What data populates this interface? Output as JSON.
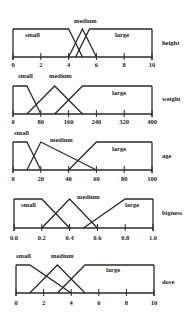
{
  "diagram": {
    "type": "fuzzy-membership-functions",
    "line_color": "#2a2a2a",
    "panels": [
      {
        "variable": "height",
        "frame": {
          "left": 13,
          "right": 152,
          "top": 29,
          "base": 57
        },
        "xmin": 0,
        "xmax": 10,
        "ticks": [
          "0",
          "2",
          "4",
          "6",
          "8",
          "10"
        ],
        "label_y": 43,
        "tick_label_y": 67,
        "sets": [
          {
            "name": "small",
            "points": [
              [
                0,
                1
              ],
              [
                4,
                1
              ],
              [
                5,
                0
              ]
            ],
            "label_x": 25,
            "label_y": 37
          },
          {
            "name": "medium",
            "points": [
              [
                4,
                0
              ],
              [
                5,
                1
              ],
              [
                6,
                0
              ]
            ],
            "label_x": 74,
            "label_y": 23
          },
          {
            "name": "large",
            "points": [
              [
                4.5,
                0
              ],
              [
                5.5,
                1
              ],
              [
                10,
                1
              ]
            ],
            "label_x": 115,
            "label_y": 37
          }
        ]
      },
      {
        "variable": "weight",
        "frame": {
          "left": 13,
          "right": 152,
          "top": 86,
          "base": 114
        },
        "xmin": 0,
        "xmax": 400,
        "ticks": [
          "0",
          "80",
          "160",
          "240",
          "320",
          "400"
        ],
        "label_y": 99,
        "tick_label_y": 124,
        "sets": [
          {
            "name": "small",
            "points": [
              [
                0,
                1
              ],
              [
                40,
                1
              ],
              [
                80,
                0
              ]
            ],
            "label_x": 18,
            "label_y": 78
          },
          {
            "name": "medium",
            "points": [
              [
                40,
                0
              ],
              [
                120,
                1
              ],
              [
                200,
                0
              ]
            ],
            "label_x": 49,
            "label_y": 78
          },
          {
            "name": "large",
            "points": [
              [
                120,
                0
              ],
              [
                200,
                1
              ],
              [
                400,
                1
              ]
            ],
            "label_x": 112,
            "label_y": 95
          }
        ]
      },
      {
        "variable": "age",
        "frame": {
          "left": 13,
          "right": 152,
          "top": 142,
          "base": 170
        },
        "xmin": 0,
        "xmax": 100,
        "ticks": [
          "0",
          "20",
          "40",
          "60",
          "80",
          "100"
        ],
        "label_y": 156,
        "tick_label_y": 181,
        "sets": [
          {
            "name": "small",
            "points": [
              [
                0,
                1
              ],
              [
                10,
                1
              ],
              [
                20,
                0
              ]
            ],
            "label_x": 14,
            "label_y": 135
          },
          {
            "name": "medium",
            "points": [
              [
                10,
                0
              ],
              [
                20,
                1
              ],
              [
                60,
                0
              ]
            ],
            "label_x": 50,
            "label_y": 142
          },
          {
            "name": "large",
            "points": [
              [
                40,
                0
              ],
              [
                60,
                1
              ],
              [
                100,
                1
              ]
            ],
            "label_x": 112,
            "label_y": 151
          }
        ]
      },
      {
        "variable": "bigness",
        "frame": {
          "left": 14,
          "right": 153,
          "top": 199,
          "base": 228
        },
        "xmin": 0.0,
        "xmax": 1.0,
        "ticks": [
          "0.0",
          "0.2",
          "0.4",
          "0.6",
          "0.8",
          "1.0"
        ],
        "label_y": 213,
        "tick_label_y": 240,
        "sets": [
          {
            "name": "small",
            "points": [
              [
                0,
                1
              ],
              [
                0.2,
                1
              ],
              [
                0.4,
                0
              ]
            ],
            "label_x": 21,
            "label_y": 207
          },
          {
            "name": "medium",
            "points": [
              [
                0.2,
                0
              ],
              [
                0.4,
                1
              ],
              [
                0.6,
                0
              ]
            ],
            "label_x": 77,
            "label_y": 199
          },
          {
            "name": "large",
            "points": [
              [
                0.5,
                0
              ],
              [
                0.8,
                1
              ],
              [
                1.0,
                1
              ]
            ],
            "label_x": 125,
            "label_y": 207
          }
        ]
      },
      {
        "variable": "dose",
        "frame": {
          "left": 16,
          "right": 154,
          "top": 265,
          "base": 293
        },
        "xmin": 0,
        "xmax": 10,
        "ticks": [
          "0",
          "2",
          "4",
          "6",
          "8",
          "10"
        ],
        "label_y": 282,
        "tick_label_y": 305,
        "sets": [
          {
            "name": "small",
            "points": [
              [
                0,
                1
              ],
              [
                1,
                1
              ],
              [
                4,
                0
              ]
            ],
            "label_x": 16,
            "label_y": 258
          },
          {
            "name": "medium",
            "points": [
              [
                1,
                0
              ],
              [
                3,
                1
              ],
              [
                5,
                0
              ]
            ],
            "label_x": 51,
            "label_y": 258
          },
          {
            "name": "large",
            "points": [
              [
                3,
                0
              ],
              [
                5,
                1
              ],
              [
                10,
                1
              ]
            ],
            "label_x": 106,
            "label_y": 272
          }
        ]
      }
    ]
  }
}
